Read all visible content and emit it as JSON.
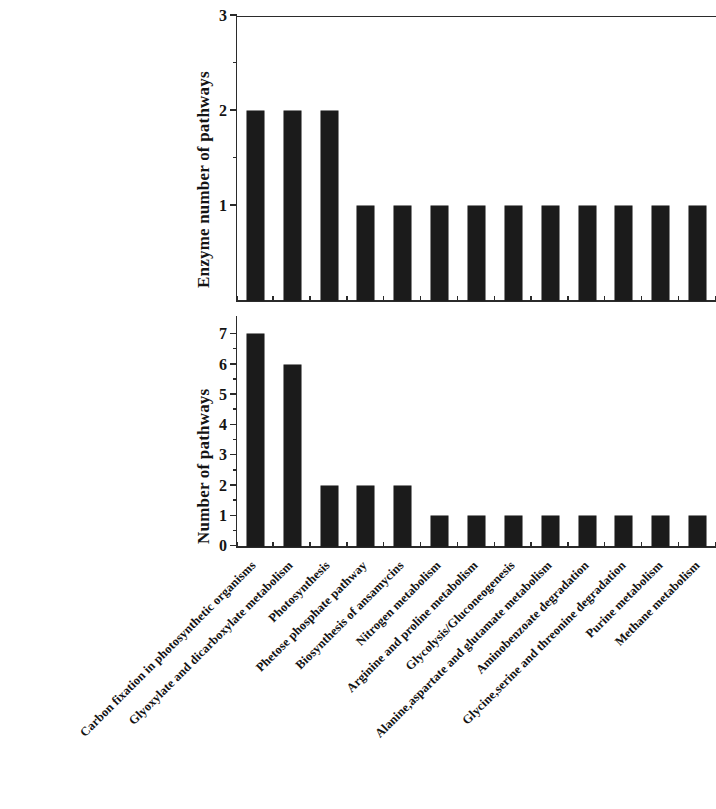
{
  "chart_data": {
    "type": "bar",
    "title": "",
    "subtitle": "",
    "xlabel": "",
    "grid": false,
    "legend": "none",
    "orientation": "vertical",
    "bar_color": "#1b1b1b",
    "categories": [
      "Carbon fixation in photosynthetic organisms",
      "Glyoxylate and dicarboxylate metabolism",
      "Photosynthesis",
      "Phetose phosphate pathway",
      "Biosynthesis of ansamycins",
      "Nitrogen metabolism",
      "Arginine and proline metabolism",
      "Glycolysis/Gluconeogenesis",
      "Alanine,aspartate and glutamate metabolism",
      "Aminobenzoate degradation",
      "Glycine,serine and threonine degradation",
      "Purine metabolism",
      "Methane metabolism"
    ],
    "panels": [
      {
        "id": "top",
        "ylabel": "Enzyme number of pathways",
        "ylim": [
          0,
          3
        ],
        "yticks": [
          1,
          2,
          3
        ],
        "ytick_labels": [
          "1",
          "2",
          "3"
        ],
        "values": [
          2,
          2,
          2,
          1,
          1,
          1,
          1,
          1,
          1,
          1,
          1,
          1,
          1
        ]
      },
      {
        "id": "bottom",
        "ylabel": "Number of pathways",
        "ylim": [
          0,
          7.6
        ],
        "yticks": [
          0,
          1,
          2,
          3,
          4,
          5,
          6,
          7
        ],
        "ytick_labels": [
          "0",
          "1",
          "2",
          "3",
          "4",
          "5",
          "6",
          "7"
        ],
        "values": [
          7,
          6,
          2,
          2,
          2,
          1,
          1,
          1,
          1,
          1,
          1,
          1,
          1
        ]
      }
    ]
  }
}
